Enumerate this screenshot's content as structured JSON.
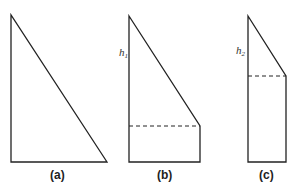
{
  "figures": [
    {
      "id": "a",
      "caption": "(a)",
      "shape": "right triangle"
    },
    {
      "id": "b",
      "caption": "(b)",
      "shape": "truncated triangle with rectangle base",
      "height_label": "h",
      "height_sub": "1"
    },
    {
      "id": "c",
      "caption": "(c)",
      "shape": "truncated triangle with rectangle base",
      "height_label": "h",
      "height_sub": "2"
    }
  ],
  "colors": {
    "stroke": "#222222",
    "background": "#ffffff"
  }
}
